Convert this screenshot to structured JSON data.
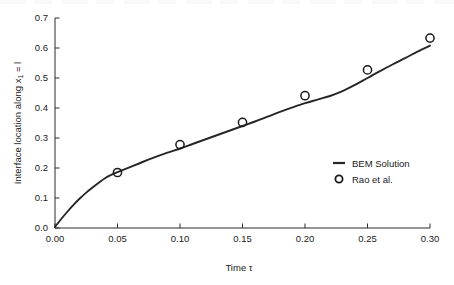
{
  "chart_data": {
    "type": "line",
    "title": "",
    "subtitle": "",
    "xlabel": "Time τ",
    "ylabel": "Interface location along x₁ = l",
    "xlim": [
      0.0,
      0.3
    ],
    "ylim": [
      0.0,
      0.7
    ],
    "grid": false,
    "legend_position": "center-right",
    "xticks": [
      "0.00",
      "0.05",
      "0.10",
      "0.15",
      "0.20",
      "0.25",
      "0.30"
    ],
    "xtick_values": [
      0.0,
      0.05,
      0.1,
      0.15,
      0.2,
      0.25,
      0.3
    ],
    "yticks": [
      "0.0",
      "0.1",
      "0.2",
      "0.3",
      "0.4",
      "0.5",
      "0.6",
      "0.7"
    ],
    "ytick_values": [
      0.0,
      0.1,
      0.2,
      0.3,
      0.4,
      0.5,
      0.6,
      0.7
    ],
    "series": [
      {
        "name": "BEM Solution",
        "type": "line",
        "marker": "none",
        "color": "#262626",
        "x": [
          0.0,
          0.005,
          0.01,
          0.015,
          0.02,
          0.025,
          0.03,
          0.035,
          0.04,
          0.045,
          0.05,
          0.06,
          0.07,
          0.08,
          0.09,
          0.1,
          0.11,
          0.12,
          0.13,
          0.14,
          0.15,
          0.16,
          0.17,
          0.18,
          0.19,
          0.2,
          0.21,
          0.22,
          0.23,
          0.24,
          0.25,
          0.26,
          0.27,
          0.28,
          0.29,
          0.3
        ],
        "y": [
          0.004,
          0.03,
          0.055,
          0.078,
          0.099,
          0.118,
          0.135,
          0.151,
          0.166,
          0.177,
          0.186,
          0.203,
          0.22,
          0.236,
          0.251,
          0.265,
          0.28,
          0.295,
          0.31,
          0.325,
          0.34,
          0.355,
          0.371,
          0.387,
          0.402,
          0.416,
          0.428,
          0.44,
          0.456,
          0.477,
          0.5,
          0.523,
          0.545,
          0.566,
          0.588,
          0.608
        ]
      },
      {
        "name": "Rao et al.",
        "type": "scatter",
        "marker": "open-circle",
        "color": "#1a1a1a",
        "x": [
          0.05,
          0.1,
          0.15,
          0.2,
          0.25,
          0.3
        ],
        "y": [
          0.185,
          0.278,
          0.352,
          0.441,
          0.527,
          0.633
        ]
      }
    ],
    "legend": [
      {
        "label": "BEM Solution",
        "marker": "line"
      },
      {
        "label": "Rao et al.",
        "marker": "open-circle"
      }
    ]
  },
  "colors": {
    "background": "#ffffff",
    "axis": "#2b2b2b",
    "curve": "#262626",
    "marker": "#1a1a1a",
    "text": "#1a1a1a"
  }
}
